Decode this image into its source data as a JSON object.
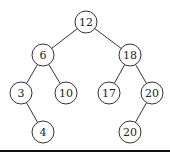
{
  "diagram": {
    "type": "binary-tree",
    "nodes": [
      {
        "id": "n12",
        "label": "12",
        "x": 86,
        "y": 22
      },
      {
        "id": "n6",
        "label": "6",
        "x": 43,
        "y": 55
      },
      {
        "id": "n18",
        "label": "18",
        "x": 130,
        "y": 55
      },
      {
        "id": "n3",
        "label": "3",
        "x": 21,
        "y": 93
      },
      {
        "id": "n10",
        "label": "10",
        "x": 66,
        "y": 93
      },
      {
        "id": "n17",
        "label": "17",
        "x": 109,
        "y": 93
      },
      {
        "id": "n20a",
        "label": "20",
        "x": 152,
        "y": 93
      },
      {
        "id": "n4",
        "label": "4",
        "x": 43,
        "y": 132
      },
      {
        "id": "n20b",
        "label": "20",
        "x": 130,
        "y": 132
      }
    ],
    "edges": [
      [
        "n12",
        "n6"
      ],
      [
        "n12",
        "n18"
      ],
      [
        "n6",
        "n3"
      ],
      [
        "n6",
        "n10"
      ],
      [
        "n18",
        "n17"
      ],
      [
        "n18",
        "n20a"
      ],
      [
        "n3",
        "n4"
      ],
      [
        "n20a",
        "n20b"
      ]
    ]
  }
}
